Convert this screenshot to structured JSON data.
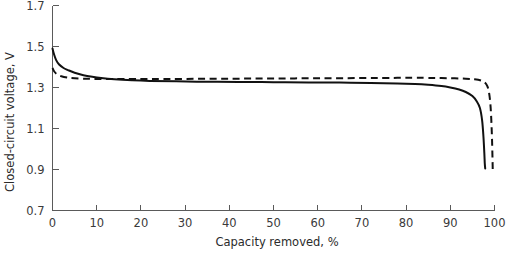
{
  "chart_data": {
    "type": "line",
    "title": "",
    "xlabel": "Capacity removed, %",
    "ylabel": "Closed-circuit voltage, V",
    "xlim": [
      0,
      100
    ],
    "ylim": [
      0.7,
      1.7
    ],
    "xticks": [
      0,
      10,
      20,
      30,
      40,
      50,
      60,
      70,
      80,
      90,
      100
    ],
    "xticklabels": [
      "0",
      "10",
      "20",
      "30",
      "40",
      "50",
      "60",
      "70",
      "80",
      "90",
      "100"
    ],
    "yticks": [
      0.7,
      0.9,
      1.1,
      1.3,
      1.5,
      1.7
    ],
    "yticklabels": [
      "0.7",
      "0.9",
      "1.1",
      "1.3",
      "1.5",
      "1.7"
    ],
    "grid": false,
    "legend": "none",
    "series": [
      {
        "name": "solid-curve",
        "style": "solid",
        "color": "#111111",
        "x": [
          0,
          0.3,
          0.8,
          1.5,
          2.5,
          3.5,
          5,
          7,
          9,
          11,
          14,
          18,
          22,
          28,
          35,
          42,
          50,
          58,
          65,
          72,
          78,
          82,
          85,
          88,
          90,
          92,
          93.5,
          95,
          96,
          96.7,
          97.2,
          97.5,
          97.7,
          97.8,
          97.9
        ],
        "y": [
          1.49,
          1.465,
          1.435,
          1.412,
          1.395,
          1.385,
          1.372,
          1.36,
          1.352,
          1.346,
          1.34,
          1.335,
          1.332,
          1.33,
          1.328,
          1.327,
          1.326,
          1.325,
          1.324,
          1.322,
          1.32,
          1.317,
          1.313,
          1.307,
          1.3,
          1.29,
          1.278,
          1.258,
          1.232,
          1.2,
          1.14,
          1.06,
          0.98,
          0.93,
          0.905
        ]
      },
      {
        "name": "dashed-curve",
        "style": "dashed",
        "color": "#111111",
        "x": [
          0,
          0.4,
          1,
          2,
          3.5,
          5,
          7,
          9,
          12,
          16,
          22,
          30,
          40,
          50,
          60,
          70,
          78,
          84,
          88,
          91,
          93.5,
          95.5,
          97,
          97.8,
          98.4,
          98.8,
          99.1,
          99.3,
          99.45,
          99.55,
          99.6
        ],
        "y": [
          1.395,
          1.378,
          1.365,
          1.355,
          1.348,
          1.345,
          1.343,
          1.342,
          1.341,
          1.341,
          1.341,
          1.342,
          1.343,
          1.344,
          1.345,
          1.346,
          1.347,
          1.347,
          1.346,
          1.345,
          1.343,
          1.34,
          1.334,
          1.325,
          1.305,
          1.27,
          1.21,
          1.13,
          1.04,
          0.95,
          0.9
        ]
      }
    ]
  }
}
